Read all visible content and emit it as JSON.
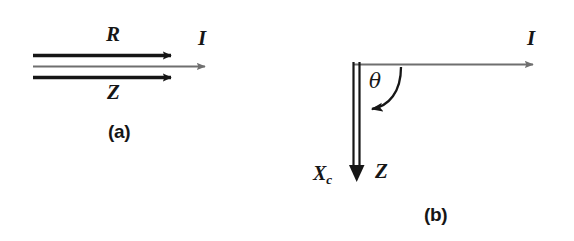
{
  "figure": {
    "caption_a": "(a)",
    "caption_b": "(b)",
    "background_color": "#ffffff",
    "ink_color": "#161616",
    "gray_color": "#6f6f6f"
  },
  "panel_a": {
    "name": "series-RL-impedance-phasor",
    "label_R": "R",
    "label_Z": "Z",
    "label_I": "I",
    "caption": "(a)",
    "arrows": [
      {
        "name": "resistance-vector-R",
        "label": "R",
        "color": "#161616",
        "from_x": 33,
        "from_y": 55,
        "to_x": 178,
        "to_y": 55
      },
      {
        "name": "current-vector-I",
        "label": "I",
        "color": "#6f6f6f",
        "from_x": 33,
        "from_y": 66,
        "to_x": 212,
        "to_y": 66
      },
      {
        "name": "impedance-vector-Z",
        "label": "Z",
        "color": "#161616",
        "from_x": 33,
        "from_y": 77,
        "to_x": 178,
        "to_y": 77
      }
    ]
  },
  "panel_b": {
    "name": "capacitive-reactance-phasor",
    "label_I": "I",
    "label_Z": "Z",
    "label_Xc": "X",
    "label_Xc_subscript": "c",
    "label_theta": "θ",
    "caption": "(b)",
    "vertices": {
      "origin_x": 355,
      "origin_y": 62
    },
    "arrows": [
      {
        "name": "current-vector-I",
        "label": "I",
        "color": "#6f6f6f",
        "from_x": 355,
        "from_y": 65,
        "to_x": 540,
        "to_y": 65
      },
      {
        "name": "impedance-vector-Z",
        "label": "Z",
        "color": "#161616",
        "from_x": 355,
        "from_y": 62,
        "to_x": 355,
        "to_y": 182
      }
    ],
    "angle_arc": {
      "name": "phase-angle-theta",
      "label": "θ",
      "from_deg": 0,
      "to_deg": 90,
      "direction": "clockwise-to-vertical"
    }
  }
}
